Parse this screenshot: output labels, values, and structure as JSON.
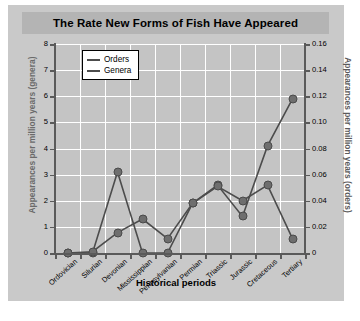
{
  "chart_data": {
    "type": "line",
    "title": "The Rate New Forms of Fish Have Appeared",
    "xlabel": "Historical periods",
    "ylabel": "Appearances per million years (genera)",
    "ylabel_right": "Appearances per million years (orders)",
    "categories": [
      "Ordovician",
      "Silurian",
      "Devonian",
      "Mississippian",
      "Pennsylvanian",
      "Permian",
      "Triassic",
      "Jurassic",
      "Cretaceous",
      "Tertiary"
    ],
    "series": [
      {
        "name": "Orders",
        "axis": "right",
        "values": [
          0,
          0,
          0.062,
          0,
          0,
          0.038,
          0.052,
          0.028,
          0.082,
          0.118
        ]
      },
      {
        "name": "Genera",
        "axis": "left",
        "values": [
          0,
          0.05,
          0.78,
          1.3,
          0.55,
          1.9,
          2.55,
          2.0,
          2.6,
          0.55
        ]
      }
    ],
    "ylim": [
      0,
      8
    ],
    "yticks": [
      "0",
      "1",
      "2",
      "3",
      "4",
      "5",
      "6",
      "7",
      "8"
    ],
    "ylim_right": [
      0,
      0.16
    ],
    "yticks_right": [
      "0",
      "0.02",
      "0.04",
      "0.06",
      "0.08",
      "0.10",
      "0.12",
      "0.14",
      "0.16"
    ],
    "grid": true,
    "legend_position": "upper-left",
    "legend": [
      "Orders",
      "Genera"
    ],
    "series_color": "#4c4c4c",
    "marker_color": "#6e6e6e",
    "plot_background": "#c4c4c4",
    "figure_background": "#c9c9c9",
    "title_band_color": "#b4b4b4",
    "grid_color": "#ffffff"
  }
}
